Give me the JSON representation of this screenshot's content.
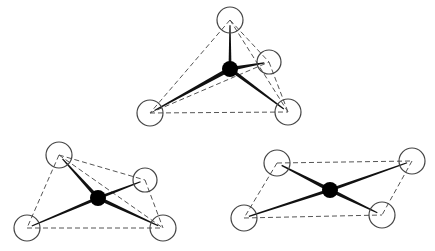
{
  "diagram": {
    "colors": {
      "background": "#ffffff",
      "stroke": "#111111",
      "dashed": "#555555",
      "center": "#000000"
    },
    "figures": [
      {
        "name": "tetrahedral",
        "center": {
          "x": 230,
          "y": 69,
          "r": 8
        },
        "ligands": [
          {
            "x": 230,
            "y": 20,
            "r": 13
          },
          {
            "x": 269,
            "y": 62,
            "r": 12
          },
          {
            "x": 150,
            "y": 113,
            "r": 13
          },
          {
            "x": 288,
            "y": 112,
            "r": 13
          }
        ],
        "bonds": [
          [
            0,
            3.0
          ],
          [
            1,
            4.0
          ],
          [
            2,
            4.5
          ],
          [
            3,
            3.5
          ]
        ],
        "dashed_edges": [
          [
            0,
            1
          ],
          [
            0,
            2
          ],
          [
            0,
            3
          ],
          [
            1,
            3
          ],
          [
            2,
            3
          ],
          [
            2,
            1
          ]
        ]
      },
      {
        "name": "seesaw",
        "center": {
          "x": 98,
          "y": 198,
          "r": 8
        },
        "ligands": [
          {
            "x": 59,
            "y": 155,
            "r": 13
          },
          {
            "x": 145,
            "y": 180,
            "r": 12
          },
          {
            "x": 27,
            "y": 228,
            "r": 13
          },
          {
            "x": 163,
            "y": 228,
            "r": 13
          }
        ],
        "bonds": [
          [
            0,
            4.0
          ],
          [
            1,
            3.0
          ],
          [
            2,
            3.0
          ],
          [
            3,
            4.0
          ]
        ],
        "dashed_edges": [
          [
            0,
            1
          ],
          [
            0,
            2
          ],
          [
            0,
            3
          ],
          [
            1,
            3
          ],
          [
            2,
            3
          ]
        ]
      },
      {
        "name": "square-planar",
        "center": {
          "x": 330,
          "y": 190,
          "r": 8
        },
        "ligands": [
          {
            "x": 277,
            "y": 163,
            "r": 13
          },
          {
            "x": 412,
            "y": 161,
            "r": 13
          },
          {
            "x": 244,
            "y": 218,
            "r": 13
          },
          {
            "x": 382,
            "y": 215,
            "r": 13
          }
        ],
        "bonds": [
          [
            0,
            4.0
          ],
          [
            1,
            3.0
          ],
          [
            2,
            3.0
          ],
          [
            3,
            4.0
          ]
        ],
        "dashed_edges": [
          [
            0,
            1
          ],
          [
            0,
            2
          ],
          [
            2,
            3
          ],
          [
            1,
            3
          ]
        ]
      }
    ]
  }
}
